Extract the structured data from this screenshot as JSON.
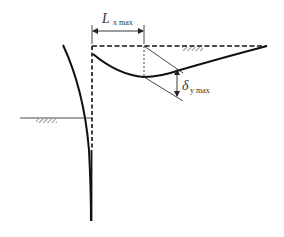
{
  "diagram": {
    "type": "retaining-wall-settlement",
    "labels": {
      "lx_main": "L",
      "lx_sub": "x max",
      "dy_main": "δ",
      "dy_sub": "y max"
    },
    "colors": {
      "line": "#111111",
      "thin": "#333333",
      "background": "#ffffff"
    }
  }
}
